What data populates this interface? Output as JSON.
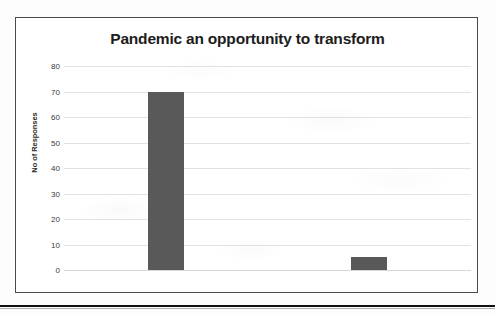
{
  "chart_data": {
    "type": "bar",
    "title": "Pandemic an opportunity to transform",
    "categories": [
      "Yes",
      "NO"
    ],
    "values": [
      70,
      5
    ],
    "xlabel": "",
    "ylabel": "No of Responses",
    "ylim": [
      0,
      80
    ],
    "ytick_values": [
      80,
      70,
      60,
      50,
      40,
      30,
      20,
      10,
      0
    ],
    "ytick_labels": [
      "80",
      "70",
      "60",
      "50",
      "40",
      "30",
      "20",
      "10",
      "0"
    ],
    "grid": true,
    "legend": null,
    "bar_color": "#595959",
    "gridline_color": "#e2e2e2",
    "title_color": "#1c1c1c",
    "frame_color": "#4a4a4a",
    "background_color": "#ffffff"
  },
  "page": {
    "background_color": "#fdfdfd",
    "bottom_rule_color": "#111111"
  }
}
